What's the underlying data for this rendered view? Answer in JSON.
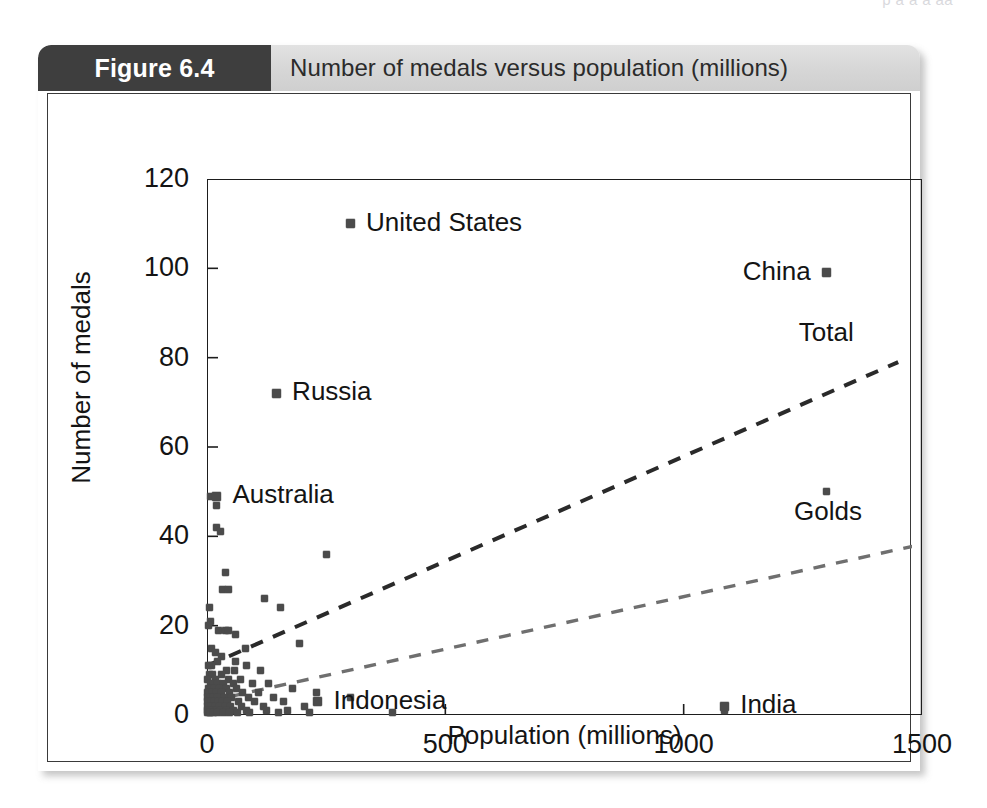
{
  "running_head": "p          a a  a aa",
  "figure": {
    "number_label": "Figure 6.4",
    "title": "Number of medals versus population (millions)"
  },
  "chart_data": {
    "type": "scatter",
    "title": "Number of medals versus population (millions)",
    "xlabel": "Population (millions)",
    "ylabel": "Number of medals",
    "xlim": [
      0,
      1500
    ],
    "ylim": [
      0,
      120
    ],
    "xticks": [
      "0",
      "500",
      "1000",
      "1500"
    ],
    "xtick_values": [
      0,
      500,
      1000,
      1500
    ],
    "yticks": [
      "0",
      "20",
      "40",
      "60",
      "80",
      "100",
      "120"
    ],
    "ytick_values": [
      0,
      20,
      40,
      60,
      80,
      100,
      120
    ],
    "grid": false,
    "legend": "none",
    "annotations": [
      {
        "label": "United States",
        "x": 300,
        "y": 110,
        "label_side": "right"
      },
      {
        "label": "China",
        "x": 1300,
        "y": 99,
        "label_side": "left"
      },
      {
        "label": "Russia",
        "x": 145,
        "y": 72,
        "label_side": "right"
      },
      {
        "label": "Australia",
        "x": 20,
        "y": 49,
        "label_side": "right"
      },
      {
        "label": "Indonesia",
        "x": 232,
        "y": 3,
        "label_side": "right"
      },
      {
        "label": "India",
        "x": 1085,
        "y": 2,
        "label_side": "right"
      }
    ],
    "fit_lines": [
      {
        "name": "Total",
        "style": "dashed",
        "x": [
          0,
          1450
        ],
        "y": [
          11,
          79
        ],
        "label_x": 1380,
        "label_y": 85
      },
      {
        "name": "Golds",
        "style": "dashed",
        "x": [
          0,
          1490
        ],
        "y": [
          3,
          38
        ],
        "label_x": 1370,
        "label_y": 45
      }
    ],
    "points": [
      [
        300,
        110
      ],
      [
        1300,
        99
      ],
      [
        145,
        72
      ],
      [
        1300,
        50
      ],
      [
        8,
        49
      ],
      [
        20,
        47
      ],
      [
        20,
        42
      ],
      [
        28,
        41
      ],
      [
        250,
        36
      ],
      [
        38,
        32
      ],
      [
        33,
        28
      ],
      [
        45,
        28
      ],
      [
        120,
        26
      ],
      [
        155,
        24
      ],
      [
        5,
        24
      ],
      [
        8,
        21
      ],
      [
        3,
        20
      ],
      [
        25,
        19
      ],
      [
        38,
        19
      ],
      [
        45,
        19
      ],
      [
        60,
        18
      ],
      [
        195,
        16
      ],
      [
        80,
        15
      ],
      [
        10,
        15
      ],
      [
        18,
        14
      ],
      [
        30,
        13
      ],
      [
        22,
        12
      ],
      [
        60,
        12
      ],
      [
        82,
        11
      ],
      [
        10,
        11
      ],
      [
        4,
        11
      ],
      [
        112,
        10
      ],
      [
        40,
        10
      ],
      [
        58,
        10
      ],
      [
        30,
        9
      ],
      [
        6,
        9
      ],
      [
        12,
        9
      ],
      [
        18,
        8
      ],
      [
        46,
        8
      ],
      [
        70,
        8
      ],
      [
        2,
        8
      ],
      [
        8,
        7
      ],
      [
        14,
        7
      ],
      [
        22,
        7
      ],
      [
        35,
        7
      ],
      [
        55,
        7
      ],
      [
        95,
        7
      ],
      [
        128,
        7
      ],
      [
        3,
        6
      ],
      [
        9,
        6
      ],
      [
        16,
        6
      ],
      [
        26,
        6
      ],
      [
        40,
        6
      ],
      [
        62,
        6
      ],
      [
        180,
        6
      ],
      [
        1,
        5
      ],
      [
        5,
        5
      ],
      [
        11,
        5
      ],
      [
        20,
        5
      ],
      [
        31,
        5
      ],
      [
        48,
        5
      ],
      [
        75,
        5
      ],
      [
        108,
        5
      ],
      [
        230,
        5
      ],
      [
        2,
        4
      ],
      [
        7,
        4
      ],
      [
        13,
        4
      ],
      [
        23,
        4
      ],
      [
        36,
        4
      ],
      [
        52,
        4
      ],
      [
        88,
        4
      ],
      [
        140,
        4
      ],
      [
        300,
        4
      ],
      [
        1,
        3
      ],
      [
        4,
        3
      ],
      [
        9,
        3
      ],
      [
        15,
        3
      ],
      [
        24,
        3
      ],
      [
        33,
        3
      ],
      [
        44,
        3
      ],
      [
        66,
        3
      ],
      [
        100,
        3
      ],
      [
        160,
        3
      ],
      [
        232,
        3
      ],
      [
        2,
        2
      ],
      [
        6,
        2
      ],
      [
        10,
        2
      ],
      [
        17,
        2
      ],
      [
        27,
        2
      ],
      [
        38,
        2
      ],
      [
        50,
        2
      ],
      [
        72,
        2
      ],
      [
        118,
        2
      ],
      [
        205,
        2
      ],
      [
        1085,
        2
      ],
      [
        1,
        1
      ],
      [
        3,
        1
      ],
      [
        7,
        1
      ],
      [
        12,
        1
      ],
      [
        19,
        1
      ],
      [
        29,
        1
      ],
      [
        41,
        1
      ],
      [
        56,
        1
      ],
      [
        83,
        1
      ],
      [
        125,
        1
      ],
      [
        168,
        1
      ],
      [
        1085,
        1
      ],
      [
        2,
        0.5
      ],
      [
        5,
        0.5
      ],
      [
        8,
        0.5
      ],
      [
        14,
        0.5
      ],
      [
        21,
        0.5
      ],
      [
        34,
        0.5
      ],
      [
        47,
        0.5
      ],
      [
        64,
        0.5
      ],
      [
        90,
        0.5
      ],
      [
        150,
        0.5
      ],
      [
        215,
        0.5
      ],
      [
        390,
        0.5
      ]
    ]
  }
}
